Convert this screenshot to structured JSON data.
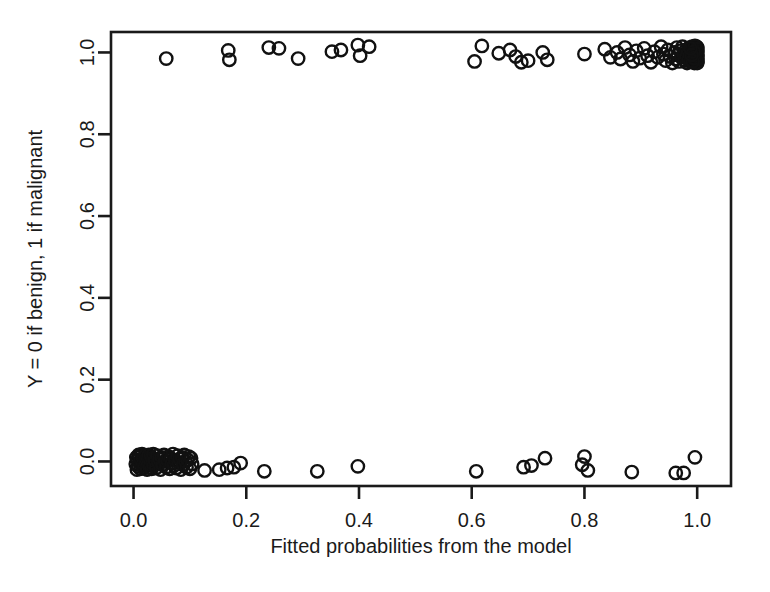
{
  "chart_data": {
    "type": "scatter",
    "title": "",
    "xlabel": "Fitted probabilities from the model",
    "ylabel": "Y = 0 if benign, 1 if malignant",
    "xlim": [
      -0.04,
      1.06
    ],
    "ylim": [
      -0.06,
      1.05
    ],
    "xticks": [
      "0.0",
      "0.2",
      "0.4",
      "0.6",
      "0.8",
      "1.0"
    ],
    "xtick_values": [
      0.0,
      0.2,
      0.4,
      0.6,
      0.8,
      1.0
    ],
    "yticks": [
      "0.0",
      "0.2",
      "0.4",
      "0.6",
      "0.8",
      "1.0"
    ],
    "ytick_values": [
      0.0,
      0.2,
      0.4,
      0.6,
      0.8,
      1.0
    ],
    "grid": false,
    "legend": "none",
    "marker": "open-circle",
    "marker_color": "#111111",
    "jitter": "vertical jitter applied to binary response",
    "series": [
      {
        "name": "Y = 1 (malignant)",
        "points": [
          [
            0.058,
            0.985
          ],
          [
            0.168,
            1.005
          ],
          [
            0.17,
            0.982
          ],
          [
            0.24,
            1.012
          ],
          [
            0.258,
            1.01
          ],
          [
            0.292,
            0.985
          ],
          [
            0.352,
            1.002
          ],
          [
            0.368,
            1.006
          ],
          [
            0.398,
            1.018
          ],
          [
            0.402,
            0.992
          ],
          [
            0.418,
            1.014
          ],
          [
            0.605,
            0.978
          ],
          [
            0.618,
            1.016
          ],
          [
            0.648,
            0.998
          ],
          [
            0.668,
            1.006
          ],
          [
            0.678,
            0.99
          ],
          [
            0.688,
            0.976
          ],
          [
            0.7,
            0.98
          ],
          [
            0.726,
            1.0
          ],
          [
            0.734,
            0.982
          ],
          [
            0.8,
            0.996
          ],
          [
            0.836,
            1.008
          ],
          [
            0.846,
            0.988
          ],
          [
            0.858,
            1.0
          ],
          [
            0.864,
            0.984
          ],
          [
            0.872,
            1.012
          ],
          [
            0.88,
            0.994
          ],
          [
            0.886,
            0.978
          ],
          [
            0.892,
            1.004
          ],
          [
            0.898,
            0.986
          ],
          [
            0.906,
            1.01
          ],
          [
            0.912,
            0.992
          ],
          [
            0.918,
            0.976
          ],
          [
            0.924,
            1.002
          ],
          [
            0.93,
            0.988
          ],
          [
            0.936,
            1.014
          ],
          [
            0.94,
            0.996
          ],
          [
            0.944,
            0.98
          ],
          [
            0.948,
            1.006
          ],
          [
            0.952,
            0.99
          ],
          [
            0.956,
            0.974
          ],
          [
            0.96,
            1.0
          ],
          [
            0.962,
            0.984
          ],
          [
            0.964,
            1.012
          ],
          [
            0.966,
            0.994
          ],
          [
            0.968,
            0.978
          ],
          [
            0.97,
            1.004
          ],
          [
            0.972,
            0.988
          ],
          [
            0.974,
            1.014
          ],
          [
            0.976,
            0.996
          ],
          [
            0.978,
            0.98
          ],
          [
            0.98,
            1.006
          ],
          [
            0.981,
            0.99
          ],
          [
            0.982,
            0.974
          ],
          [
            0.984,
            1.0
          ],
          [
            0.985,
            0.984
          ],
          [
            0.986,
            1.012
          ],
          [
            0.987,
            0.994
          ],
          [
            0.988,
            0.978
          ],
          [
            0.989,
            1.004
          ],
          [
            0.99,
            0.988
          ],
          [
            0.991,
            1.014
          ],
          [
            0.992,
            0.996
          ],
          [
            0.993,
            0.98
          ],
          [
            0.994,
            1.006
          ],
          [
            0.994,
            0.99
          ],
          [
            0.995,
            0.974
          ],
          [
            0.996,
            1.0
          ],
          [
            0.996,
            0.984
          ],
          [
            0.997,
            1.012
          ],
          [
            0.997,
            0.994
          ],
          [
            0.998,
            0.978
          ],
          [
            0.998,
            1.004
          ],
          [
            0.999,
            0.988
          ],
          [
            0.999,
            1.014
          ],
          [
            0.999,
            0.996
          ],
          [
            1.0,
            0.98
          ],
          [
            1.0,
            1.006
          ],
          [
            1.0,
            0.99
          ],
          [
            1.0,
            0.974
          ],
          [
            1.0,
            1.0
          ],
          [
            1.0,
            0.984
          ],
          [
            1.0,
            1.012
          ],
          [
            1.0,
            0.994
          ],
          [
            1.0,
            0.978
          ],
          [
            1.0,
            1.002
          ],
          [
            1.0,
            0.986
          ],
          [
            1.0,
            1.01
          ],
          [
            1.0,
            0.992
          ],
          [
            1.0,
            0.976
          ],
          [
            0.999,
            1.008
          ],
          [
            0.998,
            0.982
          ],
          [
            0.997,
            0.998
          ],
          [
            0.996,
            1.016
          ],
          [
            0.995,
            0.986
          ],
          [
            0.994,
            1.002
          ],
          [
            0.992,
            0.978
          ],
          [
            0.99,
            0.994
          ],
          [
            0.988,
            1.01
          ]
        ]
      },
      {
        "name": "Y = 0 (benign)",
        "points": [
          [
            0.004,
            -0.006
          ],
          [
            0.005,
            0.01
          ],
          [
            0.006,
            -0.02
          ],
          [
            0.007,
            0.004
          ],
          [
            0.008,
            -0.012
          ],
          [
            0.009,
            0.016
          ],
          [
            0.01,
            -0.002
          ],
          [
            0.011,
            0.012
          ],
          [
            0.012,
            -0.018
          ],
          [
            0.013,
            0.002
          ],
          [
            0.014,
            -0.008
          ],
          [
            0.015,
            0.018
          ],
          [
            0.016,
            -0.004
          ],
          [
            0.017,
            0.008
          ],
          [
            0.018,
            -0.016
          ],
          [
            0.019,
            0.0
          ],
          [
            0.02,
            -0.01
          ],
          [
            0.021,
            0.014
          ],
          [
            0.022,
            -0.002
          ],
          [
            0.023,
            0.006
          ],
          [
            0.024,
            -0.02
          ],
          [
            0.025,
            0.01
          ],
          [
            0.026,
            -0.006
          ],
          [
            0.027,
            0.016
          ],
          [
            0.028,
            0.0
          ],
          [
            0.029,
            -0.014
          ],
          [
            0.03,
            0.004
          ],
          [
            0.031,
            0.012
          ],
          [
            0.032,
            -0.018
          ],
          [
            0.033,
            0.008
          ],
          [
            0.034,
            -0.004
          ],
          [
            0.035,
            0.018
          ],
          [
            0.036,
            -0.01
          ],
          [
            0.038,
            0.002
          ],
          [
            0.04,
            -0.016
          ],
          [
            0.042,
            0.014
          ],
          [
            0.044,
            -0.002
          ],
          [
            0.046,
            0.006
          ],
          [
            0.048,
            -0.02
          ],
          [
            0.05,
            0.01
          ],
          [
            0.052,
            -0.008
          ],
          [
            0.054,
            0.016
          ],
          [
            0.056,
            0.0
          ],
          [
            0.058,
            -0.014
          ],
          [
            0.06,
            0.004
          ],
          [
            0.062,
            0.012
          ],
          [
            0.064,
            -0.018
          ],
          [
            0.066,
            0.008
          ],
          [
            0.068,
            -0.004
          ],
          [
            0.07,
            0.018
          ],
          [
            0.072,
            -0.01
          ],
          [
            0.074,
            0.002
          ],
          [
            0.076,
            -0.016
          ],
          [
            0.078,
            0.014
          ],
          [
            0.08,
            -0.002
          ],
          [
            0.082,
            0.006
          ],
          [
            0.084,
            -0.02
          ],
          [
            0.086,
            0.01
          ],
          [
            0.088,
            -0.008
          ],
          [
            0.09,
            0.016
          ],
          [
            0.092,
            0.0
          ],
          [
            0.094,
            -0.014
          ],
          [
            0.096,
            0.004
          ],
          [
            0.098,
            0.012
          ],
          [
            0.1,
            -0.018
          ],
          [
            0.102,
            0.008
          ],
          [
            0.104,
            -0.006
          ],
          [
            0.126,
            -0.022
          ],
          [
            0.152,
            -0.02
          ],
          [
            0.166,
            -0.016
          ],
          [
            0.178,
            -0.014
          ],
          [
            0.19,
            -0.004
          ],
          [
            0.232,
            -0.024
          ],
          [
            0.326,
            -0.024
          ],
          [
            0.398,
            -0.012
          ],
          [
            0.608,
            -0.024
          ],
          [
            0.692,
            -0.014
          ],
          [
            0.706,
            -0.01
          ],
          [
            0.73,
            0.008
          ],
          [
            0.796,
            -0.008
          ],
          [
            0.8,
            0.012
          ],
          [
            0.806,
            -0.022
          ],
          [
            0.884,
            -0.026
          ],
          [
            0.962,
            -0.028
          ],
          [
            0.976,
            -0.028
          ],
          [
            0.996,
            0.01
          ]
        ]
      }
    ]
  },
  "axes_geometry": {
    "plot_left_px": 111,
    "plot_right_px": 731,
    "plot_top_px": 32,
    "plot_bottom_px": 486
  }
}
